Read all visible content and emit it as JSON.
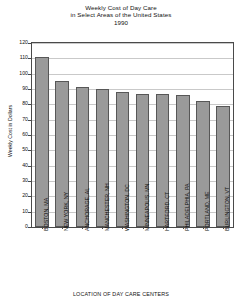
{
  "chart_data": {
    "type": "bar",
    "title": "Weekly Cost of Day Care",
    "subtitle": "in Select Areas of the United States",
    "year": "1990",
    "xlabel": "LOCATION OF DAY CARE CENTERS",
    "ylabel": "Weekly Cost in Dollars",
    "ylim": [
      0,
      120
    ],
    "ytick_step": 10,
    "yticks": [
      0,
      10,
      20,
      30,
      40,
      50,
      60,
      70,
      80,
      90,
      100,
      110,
      120
    ],
    "grid": true,
    "legend": "none",
    "bar_color": "#9a9a9a",
    "bar_border_color": "#575757",
    "categories": [
      "BOSTON, MA",
      "NEW YORK, NY",
      "ANCHORAGE, AL",
      "MANCHESTER, NH",
      "WASHINGTON, DC",
      "MINNEAPOLIS, MN",
      "HARTFORD, CT",
      "PHILADELPHIA, PA",
      "PORTLAND, ME",
      "BURLINGTON, VT"
    ],
    "values": [
      111,
      95,
      91,
      90,
      88,
      87,
      87,
      86,
      82,
      79
    ]
  }
}
